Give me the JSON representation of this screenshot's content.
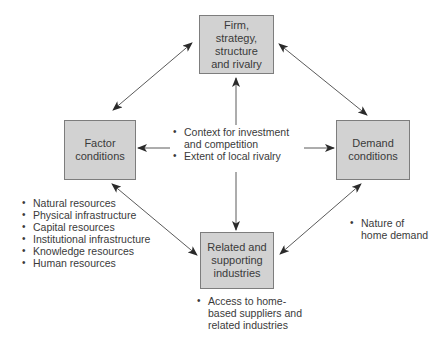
{
  "diagram": {
    "type": "Porter's Diamond",
    "colors": {
      "box_fill": "#d2d2d2",
      "box_border": "#7d7d7d",
      "arrow": "#3a3a3a",
      "text": "#3a3a3a"
    },
    "nodes": {
      "firm": {
        "label": "Firm,\nstrategy,\nstructure\nand rivalry"
      },
      "factor": {
        "label": "Factor\nconditions"
      },
      "demand": {
        "label": "Demand\nconditions"
      },
      "related": {
        "label": "Related and\nsupporting\nindustries"
      }
    },
    "center_bullets": [
      "Context for investment",
      "and competition",
      "Extent of local rivalry"
    ],
    "factor_bullets": [
      "Natural resources",
      "Physical infrastructure",
      "Capital resources",
      "Institutional infrastructure",
      "Knowledge resources",
      "Human resources"
    ],
    "demand_bullets": [
      "Nature of",
      "home demand"
    ],
    "related_bullets": [
      "Access to home-",
      "based suppliers and",
      "related industries"
    ],
    "edges": [
      {
        "from": "factor",
        "to": "firm",
        "direction": "both"
      },
      {
        "from": "firm",
        "to": "demand",
        "direction": "both"
      },
      {
        "from": "factor",
        "to": "related",
        "direction": "both"
      },
      {
        "from": "related",
        "to": "demand",
        "direction": "both"
      },
      {
        "from": "center",
        "to": "firm",
        "direction": "single"
      },
      {
        "from": "center",
        "to": "related",
        "direction": "single"
      },
      {
        "from": "center",
        "to": "factor",
        "direction": "single"
      },
      {
        "from": "center",
        "to": "demand",
        "direction": "single"
      }
    ]
  }
}
